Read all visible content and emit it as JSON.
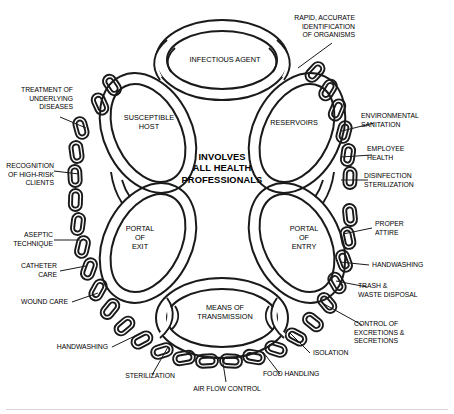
{
  "diagram": {
    "center_caption": "INVOLVES\nALL HEALTH\nPROFESSIONALS",
    "stroke_color": "#1a1a1a",
    "fill_color": "#ffffff",
    "background_color": "#ffffff",
    "nodes": [
      {
        "id": "infectious-agent",
        "label": "INFECTIOUS AGENT"
      },
      {
        "id": "reservoirs",
        "label": "RESERVOIRS"
      },
      {
        "id": "portal-of-entry",
        "label": "PORTAL\nOF\nENTRY"
      },
      {
        "id": "means-of-transmission",
        "label": "MEANS OF\nTRANSMISSION"
      },
      {
        "id": "portal-of-exit",
        "label": "PORTAL\nOF\nEXIT"
      },
      {
        "id": "susceptible-host",
        "label": "SUSCEPTIBLE\nHOST"
      }
    ],
    "interventions": [
      {
        "id": "rapid-accurate-identification",
        "label": "RAPID, ACCURATE\nIDENTIFICATION\nOF ORGANISMS",
        "side": "top-right"
      },
      {
        "id": "environmental-sanitation",
        "label": "ENVIRONMENTAL\nSANITATION",
        "side": "right"
      },
      {
        "id": "employee-health",
        "label": "EMPLOYEE\nHEALTH",
        "side": "right"
      },
      {
        "id": "disinfection-sterilization",
        "label": "DISINFECTION\nSTERILIZATION",
        "side": "right"
      },
      {
        "id": "proper-attire",
        "label": "PROPER\nATTIRE",
        "side": "right"
      },
      {
        "id": "handwashing-right",
        "label": "HANDWASHING",
        "side": "right"
      },
      {
        "id": "trash-waste-disposal",
        "label": "TRASH &\nWASTE DISPOSAL",
        "side": "right"
      },
      {
        "id": "control-of-excretions",
        "label": "CONTROL OF\nEXCRETIONS &\nSECRETIONS",
        "side": "right"
      },
      {
        "id": "isolation",
        "label": "ISOLATION",
        "side": "bottom-right"
      },
      {
        "id": "food-handling",
        "label": "FOOD HANDLING",
        "side": "bottom"
      },
      {
        "id": "air-flow-control",
        "label": "AIR FLOW CONTROL",
        "side": "bottom"
      },
      {
        "id": "sterilization",
        "label": "STERILIZATION",
        "side": "bottom"
      },
      {
        "id": "handwashing-bottom",
        "label": "HANDWASHING",
        "side": "bottom-left"
      },
      {
        "id": "wound-care",
        "label": "WOUND CARE",
        "side": "left"
      },
      {
        "id": "catheter-care",
        "label": "CATHETER\nCARE",
        "side": "left"
      },
      {
        "id": "aseptic-technique",
        "label": "ASEPTIC\nTECHNIQUE",
        "side": "left"
      },
      {
        "id": "recognition-high-risk",
        "label": "RECOGNITION\nOF HIGH-RISK\nCLIENTS",
        "side": "left"
      },
      {
        "id": "treatment-underlying-diseases",
        "label": "TREATMENT OF\nUNDERLYING\nDISEASES",
        "side": "top-left"
      }
    ]
  }
}
